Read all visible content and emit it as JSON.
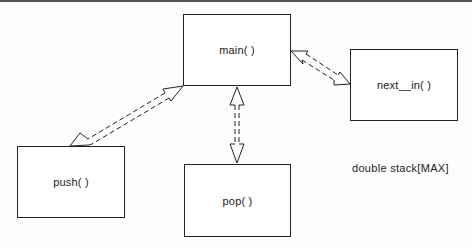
{
  "diagram": {
    "modules": [
      {
        "id": "main",
        "label": "main( )",
        "x": 183,
        "y": 14,
        "w": 108,
        "h": 72
      },
      {
        "id": "next_in",
        "label": "next__in( )",
        "x": 350,
        "y": 49,
        "w": 108,
        "h": 72
      },
      {
        "id": "push",
        "label": "push( )",
        "x": 17,
        "y": 146,
        "w": 108,
        "h": 72
      },
      {
        "id": "pop",
        "label": "pop( )",
        "x": 184,
        "y": 164,
        "w": 107,
        "h": 73
      }
    ],
    "connections": [
      {
        "from": "main",
        "to": "push",
        "style": "dashed double-headed hollow arrow"
      },
      {
        "from": "main",
        "to": "pop",
        "style": "dashed double-headed hollow arrow"
      },
      {
        "from": "main",
        "to": "next_in",
        "style": "dashed double-headed hollow arrow"
      }
    ],
    "annotation": "double stack[MAX]"
  }
}
